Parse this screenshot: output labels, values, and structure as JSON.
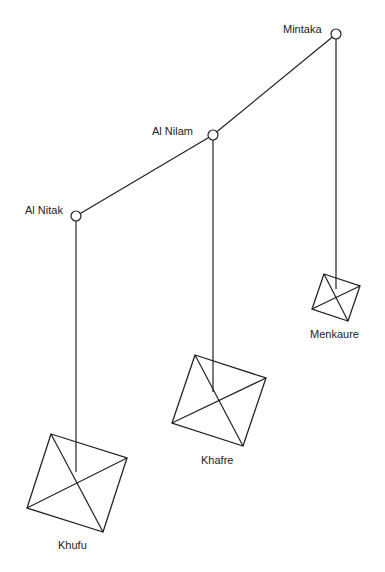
{
  "diagram": {
    "title": "",
    "stroke_color": "#222222",
    "background": "#ffffff",
    "stars": [
      {
        "name": "Mintaka",
        "icon": "star-circle-icon",
        "cx": 336,
        "cy": 34,
        "r": 5,
        "label_x": 283,
        "label_y": 24
      },
      {
        "name": "Al Nilam",
        "icon": "star-circle-icon",
        "cx": 213,
        "cy": 135,
        "r": 5,
        "label_x": 152,
        "label_y": 126
      },
      {
        "name": "Al Nitak",
        "icon": "star-circle-icon",
        "cx": 76,
        "cy": 216,
        "r": 5,
        "label_x": 25,
        "label_y": 205
      }
    ],
    "pyramids": [
      {
        "name": "Khufu",
        "icon": "pyramid-square-icon",
        "star": "Al Nitak",
        "vertices": [
          [
            51,
            434
          ],
          [
            127,
            458
          ],
          [
            103,
            532
          ],
          [
            27,
            508
          ]
        ],
        "apex": [
          76,
          472
        ],
        "label_x": 58,
        "label_y": 540
      },
      {
        "name": "Khafre",
        "icon": "pyramid-square-icon",
        "star": "Al Nilam",
        "vertices": [
          [
            195,
            355
          ],
          [
            266,
            378
          ],
          [
            243,
            446
          ],
          [
            172,
            423
          ]
        ],
        "apex": [
          213,
          392
        ],
        "label_x": 201,
        "label_y": 455
      },
      {
        "name": "Menkaure",
        "icon": "pyramid-square-icon",
        "star": "Mintaka",
        "vertices": [
          [
            324,
            274
          ],
          [
            360,
            286
          ],
          [
            348,
            321
          ],
          [
            312,
            309
          ]
        ],
        "apex": [
          336,
          289
        ],
        "label_x": 310,
        "label_y": 329
      }
    ],
    "belt_line": {
      "from": "Mintaka",
      "through": "Al Nilam",
      "to": "Al Nitak"
    }
  }
}
